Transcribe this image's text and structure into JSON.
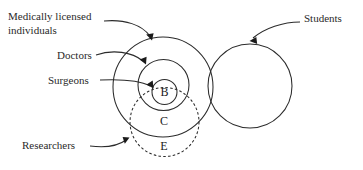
{
  "figure": {
    "type": "euler-venn-diagram",
    "background_color": "#ffffff",
    "stroke_color": "#2b2b2b",
    "text_color": "#1a1a1a"
  },
  "sets": [
    {
      "key": "medically_licensed",
      "label": "Medically licensed",
      "label_line2": "individuals",
      "style": "solid",
      "cx": 163,
      "cy": 87,
      "r": 50
    },
    {
      "key": "doctors",
      "label": "Doctors",
      "style": "solid",
      "cx": 163.5,
      "cy": 85,
      "r": 25.5
    },
    {
      "key": "surgeons",
      "label": "Surgeons",
      "style": "solid",
      "cx": 164.5,
      "cy": 92,
      "r": 12.5
    },
    {
      "key": "researchers",
      "label": "Researchers",
      "style": "dashed",
      "cx": 164.5,
      "cy": 122,
      "r": 34.5
    },
    {
      "key": "students",
      "label": "Students",
      "style": "solid",
      "cx": 250,
      "cy": 86,
      "r": 42
    }
  ],
  "region_letters": [
    {
      "letter": "B",
      "x": 164.5,
      "y": 93
    },
    {
      "letter": "C",
      "x": 164,
      "y": 122
    },
    {
      "letter": "E",
      "x": 164,
      "y": 147
    }
  ],
  "callouts": [
    {
      "key": "medically-licensed",
      "text_line1": "Medically licensed",
      "text_line2": "individuals",
      "text_x": 8,
      "text_y1": 17,
      "text_y2": 31,
      "arrow_target": "outer-circle-top"
    },
    {
      "key": "doctors",
      "text_line1": "Doctors",
      "text_x": 57,
      "text_y1": 56,
      "arrow_target": "doctors-circle"
    },
    {
      "key": "surgeons",
      "text_line1": "Surgeons",
      "text_x": 48,
      "text_y1": 81,
      "arrow_target": "surgeons-circle"
    },
    {
      "key": "researchers",
      "text_line1": "Researchers",
      "text_x": 22,
      "text_y1": 146,
      "arrow_target": "researchers-circle"
    },
    {
      "key": "students",
      "text_line1": "Students",
      "text_x": 304,
      "text_y1": 19,
      "arrow_target": "students-circle"
    }
  ]
}
